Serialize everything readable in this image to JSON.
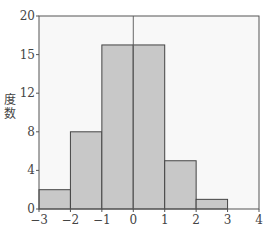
{
  "chart_data": {
    "type": "bar",
    "subtype": "histogram",
    "title": "",
    "xlabel": "",
    "ylabel": "度数",
    "bins": [
      {
        "from": -3,
        "to": -2,
        "value": 2
      },
      {
        "from": -2,
        "to": -1,
        "value": 8
      },
      {
        "from": -1,
        "to": 0,
        "value": 17
      },
      {
        "from": 0,
        "to": 1,
        "value": 17
      },
      {
        "from": 1,
        "to": 2,
        "value": 5
      },
      {
        "from": 2,
        "to": 3,
        "value": 1
      }
    ],
    "categories": [
      "-3~-2",
      "-2~-1",
      "-1~0",
      "0~1",
      "1~2",
      "2~3"
    ],
    "values": [
      2,
      8,
      17,
      17,
      5,
      1
    ],
    "xlim": [
      -3,
      4
    ],
    "ylim": [
      0,
      20
    ],
    "x_ticks": [
      -3,
      -2,
      -1,
      0,
      1,
      2,
      3,
      4
    ],
    "x_tick_labels": [
      "−3",
      "−2",
      "−1",
      "0",
      "1",
      "2",
      "3",
      "4"
    ],
    "y_ticks": [
      0,
      4,
      8,
      12,
      16,
      20
    ],
    "y_tick_labels": [
      "0",
      "4",
      "8",
      "12",
      "15",
      "20"
    ],
    "vertical_reference_line_x": 0,
    "grid": false,
    "legend": null,
    "colors": {
      "bar_fill": "#c8c8c8",
      "bar_edge": "#444444",
      "plot_bg": "#f8f8f8",
      "axis": "#555555"
    }
  }
}
